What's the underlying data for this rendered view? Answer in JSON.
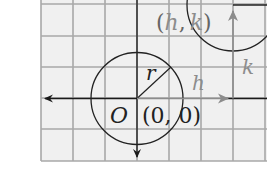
{
  "diagram": {
    "colors": {
      "grid_bg": "#f0f0f0",
      "grid_line": "#a8a8a8",
      "axis": "#1a1a1a",
      "shift": "#8c8c8c",
      "circle": "#222222"
    },
    "labels": {
      "origin_letter": "O",
      "origin_coords": "(0, 0)",
      "radius": "r",
      "h_shift": "h",
      "k_shift": "k",
      "center_open": "(",
      "center_h": "h",
      "center_comma": ",",
      "center_k": "k",
      "center_close": ")"
    },
    "circles": [
      {
        "name": "original",
        "center": "(0, 0)",
        "radius_label": "r"
      },
      {
        "name": "translated",
        "center": "(h, k)"
      }
    ]
  }
}
